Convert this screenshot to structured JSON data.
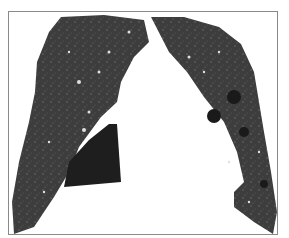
{
  "image": {
    "description": "Coronal chest CT image showing both lungs with scattered vessels, cystic lucencies in the left lung, and a dark triangular region at the right lung base",
    "colors": {
      "lung": "#3a3a3a",
      "dark_region": "#1c1c1c",
      "background": "#ffffff",
      "border": "#8a8a8a"
    }
  }
}
